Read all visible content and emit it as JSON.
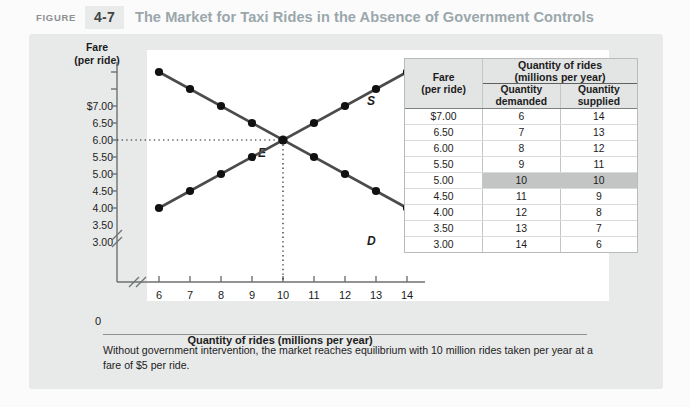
{
  "header": {
    "figure_word": "FIGURE",
    "figure_number": "4-7",
    "title": "The Market for Taxi Rides in the Absence of Government Controls",
    "title_color": "#9aa7ab",
    "badge_color": "#e9eaea"
  },
  "chart_data": {
    "type": "line",
    "title": "The Market for Taxi Rides in the Absence of Government Controls",
    "xlabel": "Quantity of rides (millions per year)",
    "ylabel": "Fare (per ride)",
    "ylabel_line1": "Fare",
    "ylabel_line2": "(per ride)",
    "x": [
      6,
      7,
      8,
      9,
      10,
      11,
      12,
      13,
      14
    ],
    "xlim": [
      6,
      14
    ],
    "ylim": [
      3.0,
      7.0
    ],
    "grid": false,
    "axis_break_x": true,
    "axis_break_y": true,
    "origin_label": "0",
    "xtick_labels": [
      "6",
      "7",
      "8",
      "9",
      "10",
      "11",
      "12",
      "13",
      "14"
    ],
    "ytick_labels": [
      "$7.00",
      "6.50",
      "6.00",
      "5.50",
      "5.00",
      "4.50",
      "4.00",
      "3.50",
      "3.00"
    ],
    "ytick_values": [
      7.0,
      6.5,
      6.0,
      5.5,
      5.0,
      4.5,
      4.0,
      3.5,
      3.0
    ],
    "series": [
      {
        "name": "D",
        "label": "D",
        "role": "demand",
        "color": "#4b4b4b",
        "x": [
          6,
          7,
          8,
          9,
          10,
          11,
          12,
          13,
          14
        ],
        "values": [
          7.0,
          6.5,
          6.0,
          5.5,
          5.0,
          4.5,
          4.0,
          3.5,
          3.0
        ]
      },
      {
        "name": "S",
        "label": "S",
        "role": "supply",
        "color": "#4b4b4b",
        "x": [
          6,
          7,
          8,
          9,
          10,
          11,
          12,
          13,
          14
        ],
        "values": [
          3.0,
          3.5,
          4.0,
          4.5,
          5.0,
          5.5,
          6.0,
          6.5,
          7.0
        ]
      }
    ],
    "annotations": [
      {
        "label": "E",
        "name": "equilibrium-point",
        "x": 10,
        "y": 5.0,
        "guide_lines": "dotted-to-axes"
      }
    ]
  },
  "table": {
    "group_header_line1": "Quantity of rides",
    "group_header_line2": "(millions per year)",
    "fare_header_line1": "Fare",
    "fare_header_line2": "(per ride)",
    "qd_header_line1": "Quantity",
    "qd_header_line2": "demanded",
    "qs_header_line1": "Quantity",
    "qs_header_line2": "supplied",
    "highlight_color": "#c3c5c5",
    "rows": [
      {
        "fare": "$7.00",
        "quantity_demanded": "6",
        "quantity_supplied": "14",
        "highlight": false
      },
      {
        "fare": "6.50",
        "quantity_demanded": "7",
        "quantity_supplied": "13",
        "highlight": false
      },
      {
        "fare": "6.00",
        "quantity_demanded": "8",
        "quantity_supplied": "12",
        "highlight": false
      },
      {
        "fare": "5.50",
        "quantity_demanded": "9",
        "quantity_supplied": "11",
        "highlight": false
      },
      {
        "fare": "5.00",
        "quantity_demanded": "10",
        "quantity_supplied": "10",
        "highlight": true
      },
      {
        "fare": "4.50",
        "quantity_demanded": "11",
        "quantity_supplied": "9",
        "highlight": false
      },
      {
        "fare": "4.00",
        "quantity_demanded": "12",
        "quantity_supplied": "8",
        "highlight": false
      },
      {
        "fare": "3.50",
        "quantity_demanded": "13",
        "quantity_supplied": "7",
        "highlight": false
      },
      {
        "fare": "3.00",
        "quantity_demanded": "14",
        "quantity_supplied": "6",
        "highlight": false
      }
    ]
  },
  "caption": {
    "text": "Without government intervention, the market reaches equilibrium with 10 million rides taken per year at a fare of $5 per ride."
  }
}
